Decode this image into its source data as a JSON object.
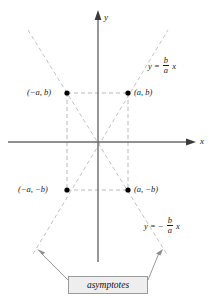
{
  "figure": {
    "background_color": "#ffffff",
    "axis_color": "#5a5a5a",
    "dash_color": "#c0c0c0",
    "point_color": "#000000",
    "text_color": "#1a1a1a",
    "box_fill": "#eeeeee",
    "box_border": "#9a9a9a"
  },
  "axes": {
    "x_label": "x",
    "y_label": "y",
    "origin": {
      "x": 98,
      "y": 142
    }
  },
  "points": [
    {
      "name": "point-neg-a-b",
      "label": "(−a, b)",
      "x": 67,
      "y": 93,
      "label_side": "left"
    },
    {
      "name": "point-a-b",
      "label": "(a, b)",
      "x": 128,
      "y": 93,
      "label_side": "right"
    },
    {
      "name": "point-neg-a-neg-b",
      "label": "(−a, −b)",
      "x": 67,
      "y": 190,
      "label_side": "left"
    },
    {
      "name": "point-a-neg-b",
      "label": "(a, −b)",
      "x": 128,
      "y": 190,
      "label_side": "right"
    }
  ],
  "equations": {
    "positive_slope": {
      "lhs": "y",
      "equals": "=",
      "sign": "",
      "numerator": "b",
      "denominator": "a",
      "variable": "x"
    },
    "negative_slope": {
      "lhs": "y",
      "equals": "=",
      "sign": "−",
      "numerator": "b",
      "denominator": "a",
      "variable": "x"
    }
  },
  "callout": {
    "label": "asymptotes",
    "arrow_left_target": {
      "x": 38,
      "y": 250
    },
    "arrow_right_target": {
      "x": 162,
      "y": 250
    }
  }
}
